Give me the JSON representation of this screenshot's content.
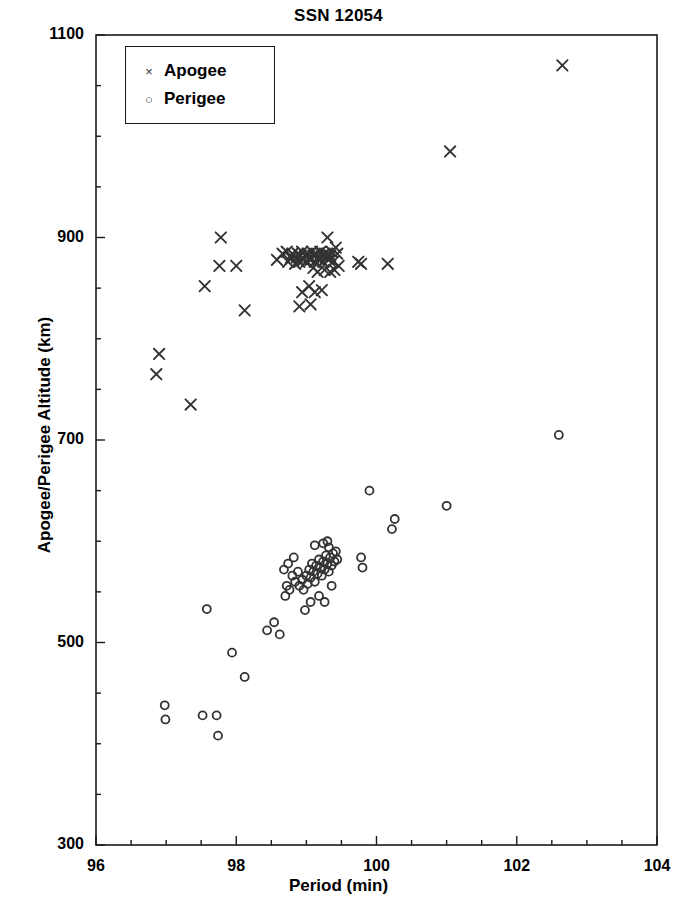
{
  "chart_data": {
    "type": "scatter",
    "title": "SSN 12054",
    "xlabel": "Period (min)",
    "ylabel": "Apogee/Perigee Altitude (km)",
    "xlim": [
      96,
      104
    ],
    "ylim": [
      300,
      1100
    ],
    "xticks": [
      96,
      98,
      100,
      102,
      104
    ],
    "yticks": [
      300,
      500,
      700,
      900,
      1100
    ],
    "x_minor_step": 0.5,
    "y_minor_step": 50,
    "grid": false,
    "legend_position": "top-left-inside",
    "marker_color": "#333333",
    "series": [
      {
        "name": "Apogee",
        "marker": "x",
        "points": [
          [
            96.9,
            785
          ],
          [
            96.86,
            765
          ],
          [
            97.35,
            735
          ],
          [
            97.78,
            900
          ],
          [
            97.76,
            872
          ],
          [
            97.55,
            852
          ],
          [
            98.0,
            872
          ],
          [
            98.12,
            828
          ],
          [
            98.58,
            878
          ],
          [
            98.66,
            884
          ],
          [
            98.72,
            886
          ],
          [
            98.74,
            876
          ],
          [
            98.78,
            880
          ],
          [
            98.8,
            884
          ],
          [
            98.84,
            874
          ],
          [
            98.86,
            880
          ],
          [
            98.88,
            884
          ],
          [
            98.9,
            876
          ],
          [
            98.92,
            882
          ],
          [
            98.94,
            886
          ],
          [
            98.96,
            878
          ],
          [
            98.98,
            882
          ],
          [
            99.0,
            876
          ],
          [
            99.02,
            884
          ],
          [
            99.04,
            880
          ],
          [
            99.06,
            878
          ],
          [
            99.08,
            886
          ],
          [
            99.1,
            882
          ],
          [
            99.12,
            876
          ],
          [
            99.14,
            884
          ],
          [
            99.16,
            880
          ],
          [
            99.18,
            878
          ],
          [
            99.2,
            886
          ],
          [
            99.22,
            882
          ],
          [
            99.24,
            876
          ],
          [
            99.26,
            884
          ],
          [
            99.28,
            880
          ],
          [
            99.3,
            884
          ],
          [
            99.32,
            878
          ],
          [
            99.34,
            882
          ],
          [
            99.36,
            886
          ],
          [
            99.38,
            876
          ],
          [
            99.3,
            900
          ],
          [
            99.42,
            890
          ],
          [
            99.44,
            884
          ],
          [
            99.46,
            872
          ],
          [
            99.4,
            868
          ],
          [
            99.34,
            866
          ],
          [
            99.26,
            868
          ],
          [
            99.16,
            866
          ],
          [
            99.1,
            870
          ],
          [
            98.94,
            846
          ],
          [
            99.04,
            852
          ],
          [
            99.12,
            846
          ],
          [
            99.22,
            848
          ],
          [
            98.9,
            832
          ],
          [
            99.06,
            834
          ],
          [
            99.74,
            876
          ],
          [
            99.78,
            874
          ],
          [
            100.16,
            874
          ],
          [
            101.05,
            985
          ],
          [
            102.65,
            1070
          ]
        ]
      },
      {
        "name": "Perigee",
        "marker": "o",
        "points": [
          [
            96.98,
            438
          ],
          [
            96.99,
            424
          ],
          [
            97.52,
            428
          ],
          [
            97.72,
            428
          ],
          [
            97.74,
            408
          ],
          [
            97.58,
            533
          ],
          [
            97.94,
            490
          ],
          [
            98.12,
            466
          ],
          [
            98.44,
            512
          ],
          [
            98.54,
            520
          ],
          [
            98.62,
            508
          ],
          [
            98.7,
            546
          ],
          [
            98.72,
            556
          ],
          [
            98.76,
            552
          ],
          [
            98.8,
            566
          ],
          [
            98.84,
            560
          ],
          [
            98.68,
            572
          ],
          [
            98.74,
            578
          ],
          [
            98.82,
            584
          ],
          [
            98.88,
            570
          ],
          [
            98.9,
            556
          ],
          [
            98.94,
            562
          ],
          [
            98.96,
            552
          ],
          [
            99.0,
            566
          ],
          [
            99.02,
            558
          ],
          [
            99.04,
            572
          ],
          [
            99.06,
            564
          ],
          [
            99.08,
            578
          ],
          [
            99.1,
            570
          ],
          [
            99.12,
            560
          ],
          [
            99.14,
            576
          ],
          [
            99.16,
            568
          ],
          [
            99.18,
            582
          ],
          [
            99.2,
            574
          ],
          [
            99.22,
            566
          ],
          [
            99.24,
            580
          ],
          [
            99.26,
            572
          ],
          [
            99.28,
            586
          ],
          [
            99.3,
            578
          ],
          [
            99.32,
            570
          ],
          [
            99.34,
            584
          ],
          [
            99.36,
            576
          ],
          [
            99.12,
            596
          ],
          [
            99.24,
            598
          ],
          [
            99.3,
            600
          ],
          [
            99.32,
            594
          ],
          [
            99.38,
            588
          ],
          [
            99.4,
            580
          ],
          [
            99.18,
            546
          ],
          [
            99.26,
            540
          ],
          [
            99.06,
            540
          ],
          [
            98.98,
            532
          ],
          [
            99.36,
            556
          ],
          [
            99.42,
            590
          ],
          [
            99.44,
            582
          ],
          [
            99.78,
            584
          ],
          [
            99.8,
            574
          ],
          [
            99.9,
            650
          ],
          [
            100.22,
            612
          ],
          [
            100.26,
            622
          ],
          [
            101.0,
            635
          ],
          [
            102.6,
            705
          ]
        ]
      }
    ]
  },
  "legend": {
    "items": [
      {
        "glyph": "×",
        "label": "Apogee"
      },
      {
        "glyph": "○",
        "label": "Perigee"
      }
    ]
  },
  "axes": {
    "x_tick_labels": [
      "96",
      "98",
      "100",
      "102",
      "104"
    ],
    "y_tick_labels": [
      "300",
      "500",
      "700",
      "900",
      "1100"
    ]
  }
}
